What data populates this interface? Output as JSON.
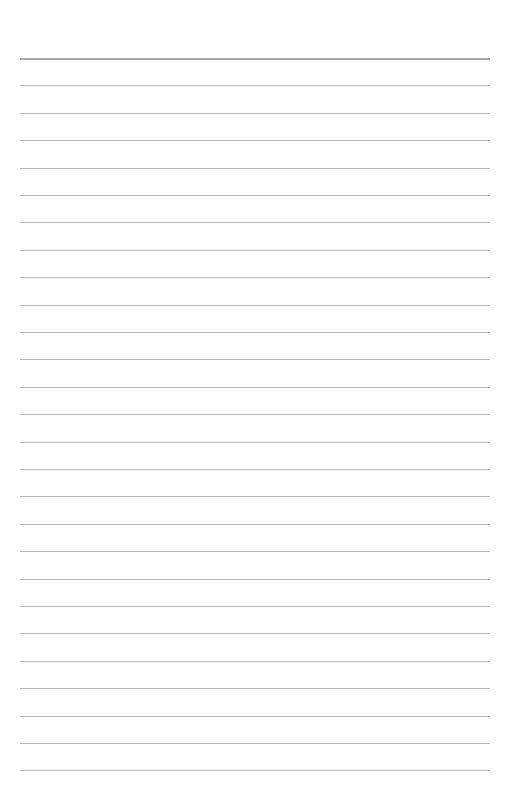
{
  "document": {
    "type": "lined-paper",
    "background_color": "#ffffff",
    "line_color": "#b9b9b9",
    "top_line_color": "#a8a8a8",
    "line_count": 27,
    "first_line_y": 58,
    "line_spacing": 27.4,
    "line_left": 20,
    "line_width": 470,
    "text": ""
  }
}
